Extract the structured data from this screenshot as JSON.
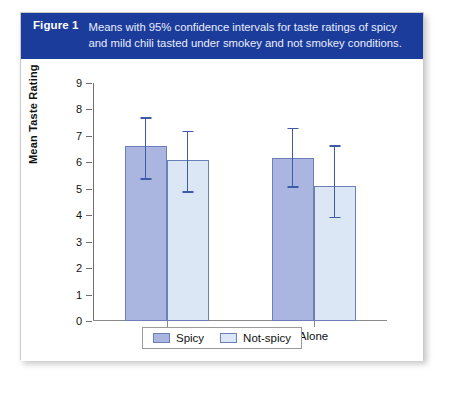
{
  "figure": {
    "number_label": "Figure 1",
    "caption": "Means with 95% confidence intervals for taste ratings of spicy and mild chili tasted under smokey and not smokey conditions.",
    "header_color": "#1b3c9b"
  },
  "legend": {
    "items": [
      {
        "label": "Spicy",
        "color": "#abb6e0"
      },
      {
        "label": "Not-spicy",
        "color": "#dbe7f4"
      }
    ]
  },
  "chart_data": {
    "type": "bar",
    "title": "",
    "xlabel": "",
    "ylabel": "Mean Taste Rating",
    "ylim": [
      0,
      9
    ],
    "yticks": [
      0,
      1,
      2,
      3,
      4,
      5,
      6,
      7,
      8,
      9
    ],
    "ytick_labels": [
      "0",
      "1",
      "2",
      "3",
      "4",
      "5",
      "6",
      "7",
      "8",
      "9"
    ],
    "categories": [
      "Smoke",
      "Alone"
    ],
    "grid": false,
    "legend_position": "bottom-center",
    "error_bar_type": "95% confidence interval",
    "series": [
      {
        "name": "Spicy",
        "color": "#abb6e0",
        "values": [
          6.6,
          6.15
        ],
        "ci_lower": [
          5.4,
          5.1
        ],
        "ci_upper": [
          7.7,
          7.3
        ]
      },
      {
        "name": "Not-spicy",
        "color": "#dbe7f4",
        "values": [
          6.1,
          5.1
        ],
        "ci_lower": [
          4.9,
          3.95
        ],
        "ci_upper": [
          7.2,
          6.65
        ]
      }
    ]
  }
}
